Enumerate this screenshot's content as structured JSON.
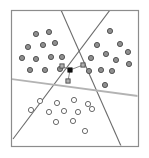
{
  "figure": {
    "canvas": {
      "width": 149,
      "height": 158,
      "background": "#ffffff"
    },
    "frame": {
      "x": 11,
      "y": 10,
      "width": 127,
      "height": 136,
      "stroke": "#8c8c8c",
      "stroke_width": 1.2
    },
    "colors": {
      "frame": "#8c8c8c",
      "boundary_dark": "#6b6b6b",
      "boundary_light": "#b3b3b3",
      "filled_point_fill": "#8f8f8f",
      "filled_point_stroke": "#4a4a4a",
      "open_point_fill": "#ffffff",
      "open_point_stroke": "#5a5a5a",
      "query_point": "#111111",
      "neighbour_marker_fill": "#b0b0b0",
      "neighbour_marker_stroke": "#4a4a4a",
      "link_line": "#6b6b6b"
    }
  },
  "chart_data": {
    "type": "scatter",
    "title": "",
    "xlabel": "",
    "ylabel": "",
    "xlim": [
      11,
      138
    ],
    "ylim": [
      10,
      146
    ],
    "grid": false,
    "legend_position": "none",
    "series": [
      {
        "name": "class-a-filled-upper-left",
        "marker": "filled-circle",
        "marker_radius": 2.6,
        "count": 12,
        "points": [
          [
            36,
            34
          ],
          [
            49,
            32
          ],
          [
            28,
            47
          ],
          [
            43,
            45
          ],
          [
            55,
            43
          ],
          [
            22,
            58
          ],
          [
            36,
            59
          ],
          [
            51,
            57
          ],
          [
            62,
            57
          ],
          [
            30,
            70
          ],
          [
            45,
            70
          ],
          [
            60,
            69
          ]
        ]
      },
      {
        "name": "class-a-filled-upper-right",
        "marker": "filled-circle",
        "marker_radius": 2.6,
        "count": 12,
        "points": [
          [
            110,
            31
          ],
          [
            97,
            45
          ],
          [
            120,
            44
          ],
          [
            106,
            54
          ],
          [
            128,
            52
          ],
          [
            91,
            58
          ],
          [
            116,
            60
          ],
          [
            129,
            64
          ],
          [
            89,
            71
          ],
          [
            101,
            70
          ],
          [
            112,
            71
          ],
          [
            105,
            85
          ]
        ]
      },
      {
        "name": "class-b-open-lower",
        "marker": "open-circle",
        "marker_radius": 2.6,
        "count": 12,
        "points": [
          [
            40,
            101
          ],
          [
            57,
            103
          ],
          [
            74,
            100
          ],
          [
            88,
            104
          ],
          [
            31,
            110
          ],
          [
            49,
            112
          ],
          [
            64,
            111
          ],
          [
            78,
            112
          ],
          [
            92,
            109
          ],
          [
            56,
            122
          ],
          [
            73,
            121
          ],
          [
            85,
            131
          ]
        ]
      }
    ],
    "query_point": {
      "name": "query-point",
      "marker": "filled-square",
      "size": 4.4,
      "position": [
        70,
        70
      ]
    },
    "neighbour_points": [
      {
        "name": "neighbour-1",
        "marker": "open-square",
        "size": 4.2,
        "position": [
          62,
          66
        ]
      },
      {
        "name": "neighbour-2",
        "marker": "open-square",
        "size": 4.2,
        "position": [
          83,
          65
        ]
      },
      {
        "name": "neighbour-3",
        "marker": "open-square",
        "size": 4.2,
        "position": [
          68,
          81
        ]
      }
    ],
    "neighbour_links": [
      {
        "name": "link-to-neighbour-1",
        "from": [
          70,
          70
        ],
        "to": [
          62,
          66
        ]
      },
      {
        "name": "link-to-neighbour-2",
        "from": [
          70,
          70
        ],
        "to": [
          83,
          65
        ]
      },
      {
        "name": "link-to-neighbour-3",
        "from": [
          70,
          70
        ],
        "to": [
          68,
          81
        ]
      }
    ],
    "boundary_lines": [
      {
        "name": "boundary-line-1",
        "from": [
          61,
          10
        ],
        "to": [
          121,
          146
        ],
        "stroke": "#6b6b6b",
        "width": 1.1
      },
      {
        "name": "boundary-line-2",
        "from": [
          110,
          10
        ],
        "to": [
          13,
          139
        ],
        "stroke": "#6b6b6b",
        "width": 1.1
      },
      {
        "name": "boundary-line-3",
        "from": [
          11,
          79
        ],
        "to": [
          138,
          96
        ],
        "stroke": "#b3b3b3",
        "width": 1.8
      }
    ]
  }
}
